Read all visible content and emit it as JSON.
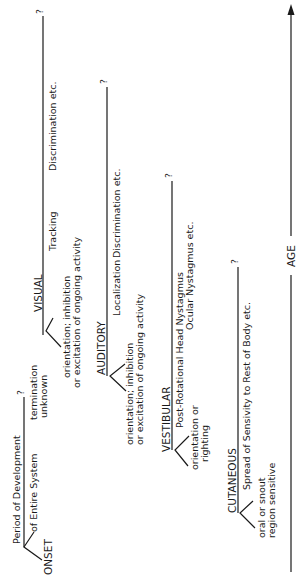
{
  "axis": {
    "label": "AGE",
    "direction": "up"
  },
  "legend": {
    "top_label": "Period of Development",
    "bottom_label": "of Entire System",
    "onset_label": "ONSET",
    "end_mark": "?",
    "termination_line1": "termination",
    "termination_line2": "unknown"
  },
  "systems": [
    {
      "name": "VISUAL",
      "end_mark": "?",
      "onset_line1": "orientation; inhibition",
      "onset_line2": "or excitation of ongoing activity",
      "stages": [
        "Tracking",
        "Discrimination  etc."
      ]
    },
    {
      "name": "AUDITORY",
      "end_mark": "?",
      "onset_line1": "orientation; inhibition",
      "onset_line2": "or excitation of ongoing activity",
      "stages": [
        "Localization",
        "Discrimination  etc."
      ]
    },
    {
      "name": "VESTIBULAR",
      "end_mark": "?",
      "onset_line1": "orientation or",
      "onset_line2": "righting",
      "stages": [
        "Post-Rotational Head Nystagmus",
        "Ocular  Nystagmus  etc."
      ]
    },
    {
      "name": "CUTANEOUS",
      "end_mark": "?",
      "onset_line1": "oral or snout",
      "onset_line2": "region sensitive",
      "stages": [
        "Spread  of  Sensivity  to  Rest  of  Body  etc."
      ]
    }
  ]
}
